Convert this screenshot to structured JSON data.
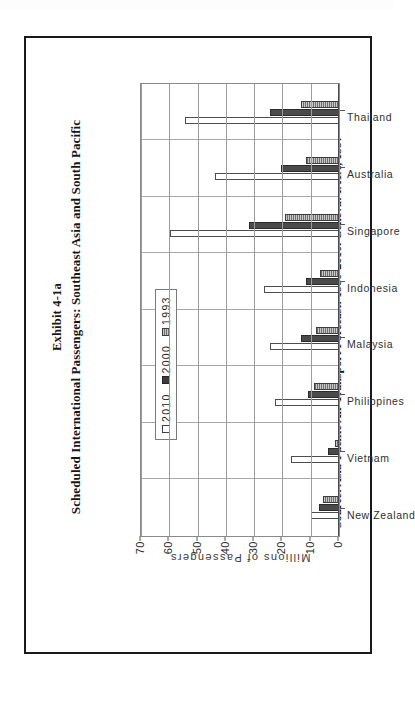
{
  "figure": {
    "title_line1": "Exhibit 4-1a",
    "title_line2": "Scheduled International Passengers: Southeast Asia and South Pacific",
    "source": "Source: Asia-Pacific Air Transport Forecast: 1980-2010. Geneva: IATA, 1997"
  },
  "chart_data": {
    "type": "bar",
    "title": "Scheduled International Passengers: Southeast Asia and South Pacific",
    "subtitle": "Exhibit 4-1a",
    "orientation": "vertical-rotated-90",
    "xlabel": "",
    "ylabel": "Millions of Passengers",
    "ylim": [
      0,
      70
    ],
    "yticks": [
      0,
      10,
      20,
      30,
      40,
      50,
      60,
      70
    ],
    "grid": true,
    "legend_position": "top-left-inside",
    "categories": [
      "New Zealand",
      "Vietnam",
      "Philippines",
      "Malaysia",
      "Indonesia",
      "Singapore",
      "Australia",
      "Thailand"
    ],
    "series": [
      {
        "name": "2010",
        "color": "#ffffff",
        "swatch": "open-square",
        "values": [
          10.0,
          17.0,
          22.5,
          24.5,
          26.5,
          59.8,
          43.8,
          54.5
        ]
      },
      {
        "name": "2000",
        "color": "#4a4a4a",
        "swatch": "filled-square",
        "values": [
          7.0,
          4.0,
          10.8,
          13.3,
          11.5,
          32.0,
          20.5,
          24.5
        ]
      },
      {
        "name": "1993",
        "color": "#9a9a9a",
        "swatch": "hatched-square",
        "values": [
          5.5,
          1.5,
          9.0,
          8.3,
          6.6,
          19.0,
          11.5,
          13.5
        ]
      }
    ]
  }
}
